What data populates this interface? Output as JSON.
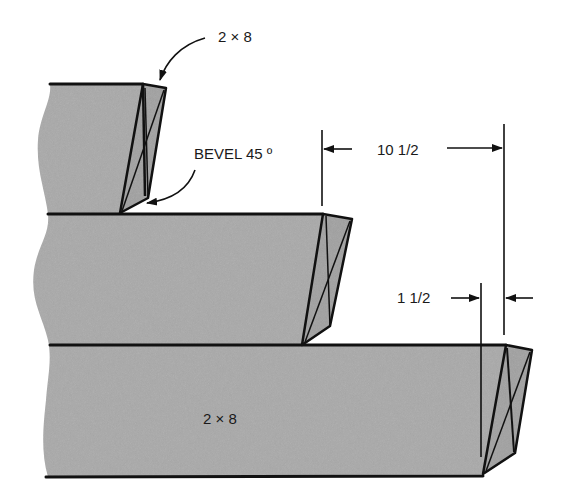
{
  "figure": {
    "type": "technical-drawing",
    "colors": {
      "board_fill": "#a9a9a9",
      "line": "#111111",
      "background": "#ffffff"
    }
  },
  "labels": {
    "top_board_callout": "2 × 8",
    "bevel_callout": "BEVEL 45 º",
    "dimension_long": "10 1/2",
    "dimension_short": "1 1/2",
    "bottom_board_label": "2 × 8"
  },
  "boards": [
    {
      "name": "top-board",
      "position": "top",
      "end": "beveled 45°"
    },
    {
      "name": "middle-board",
      "position": "middle",
      "end": "beveled 45°"
    },
    {
      "name": "bottom-board",
      "position": "bottom",
      "end": "beveled 45°"
    }
  ],
  "dimensions": [
    {
      "name": "step-offset",
      "value": "10 1/2",
      "between": "middle board end to bottom board end"
    },
    {
      "name": "bevel-thickness",
      "value": "1 1/2",
      "between": "bottom board bevel"
    }
  ]
}
